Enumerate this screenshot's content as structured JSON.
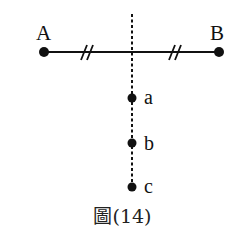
{
  "figure": {
    "caption": "圖(14)",
    "points": {
      "A": {
        "label": "A",
        "x": 44,
        "y": 52
      },
      "B": {
        "label": "B",
        "x": 219,
        "y": 52
      },
      "a": {
        "label": "a",
        "x": 132,
        "y": 98
      },
      "b": {
        "label": "b",
        "x": 132,
        "y": 143
      },
      "c": {
        "label": "c",
        "x": 132,
        "y": 187
      }
    },
    "segment_AB": {
      "equal_halves_marker": "//"
    },
    "perpendicular_bisector": {
      "style": "dotted",
      "x": 132,
      "y_top": 14,
      "y_bottom": 187
    },
    "colors": {
      "ink": "#111111",
      "background": "#ffffff"
    }
  }
}
